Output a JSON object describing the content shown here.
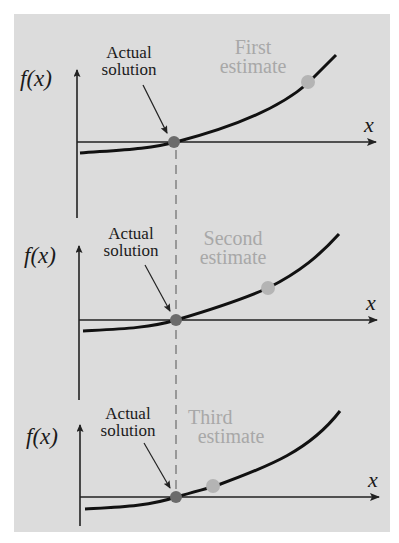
{
  "diagram": {
    "title": "",
    "colors": {
      "background": "#dcdcdc",
      "curve": "#111111",
      "axis": "#222222",
      "actual_dot": "#6b6b6b",
      "estimate_dot": "#b4b4b4",
      "estimate_text": "#a8a8a8",
      "dashed_line": "#555555"
    },
    "panels": [
      {
        "y_label": "f(x)",
        "x_label": "x",
        "actual_label_line1": "Actual",
        "actual_label_line2": "solution",
        "estimate_label_line1": "First",
        "estimate_label_line2": "estimate"
      },
      {
        "y_label": "f(x)",
        "x_label": "x",
        "actual_label_line1": "Actual",
        "actual_label_line2": "solution",
        "estimate_label_line1": "Second",
        "estimate_label_line2": "estimate"
      },
      {
        "y_label": "f(x)",
        "x_label": "x",
        "actual_label_line1": "Actual",
        "actual_label_line2": "solution",
        "estimate_label_line1": "Third",
        "estimate_label_line2": "estimate"
      }
    ]
  }
}
